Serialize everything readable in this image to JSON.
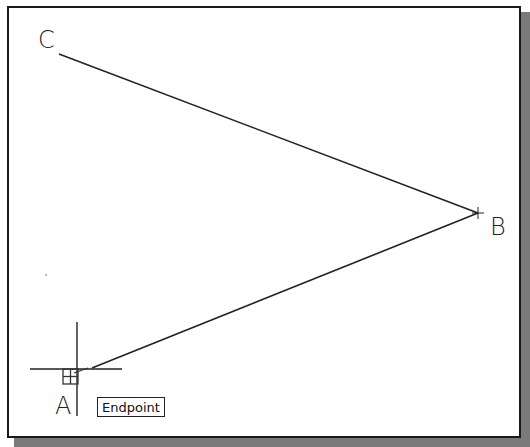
{
  "drawing": {
    "points": {
      "A": {
        "label": "A",
        "x": 80,
        "y": 370
      },
      "B": {
        "label": "B",
        "x": 478,
        "y": 213
      },
      "C": {
        "label": "C",
        "x": 59,
        "y": 54
      }
    },
    "lines": [
      {
        "from": "C",
        "to": "B"
      },
      {
        "from": "B",
        "to": "A"
      }
    ]
  },
  "cursor": {
    "type": "crosshair",
    "x": 77,
    "y": 369,
    "snap_marker": "endpoint-marker"
  },
  "tooltip": {
    "label": "Endpoint"
  },
  "colors": {
    "line": "#222222",
    "border": "#1a1a1a",
    "shadow": "#7a7a7a",
    "background": "#ffffff"
  }
}
